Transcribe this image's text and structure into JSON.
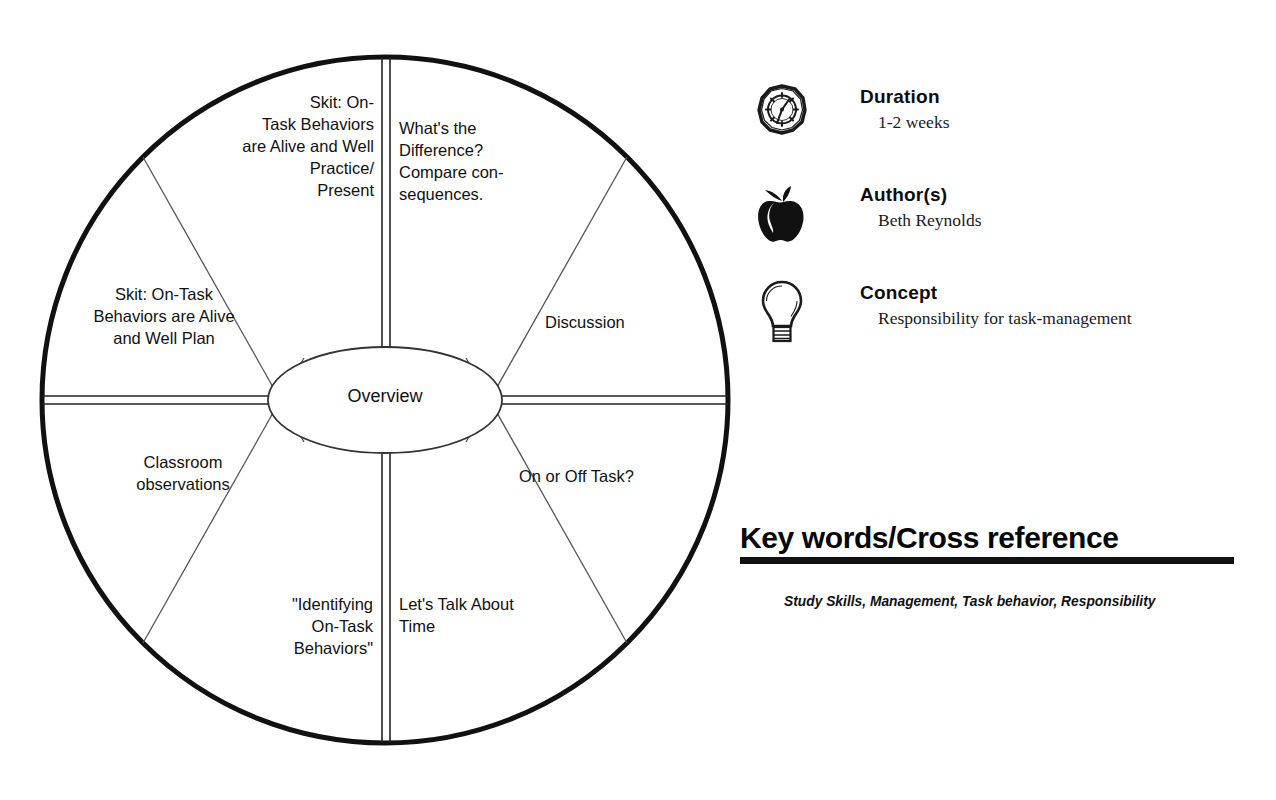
{
  "wheel": {
    "center_label": "Overview",
    "segments": [
      {
        "id": "skit-practice-present",
        "label": "Skit:  On-\nTask Behaviors\nare Alive and Well\nPractice/\nPresent",
        "align": "right"
      },
      {
        "id": "whats-the-difference",
        "label": "What's the\nDifference?\nCompare  con-\nsequences.",
        "align": "left"
      },
      {
        "id": "discussion",
        "label": "Discussion",
        "align": "left"
      },
      {
        "id": "on-or-off-task",
        "label": "On or Off Task?",
        "align": "left"
      },
      {
        "id": "lets-talk-about-time",
        "label": "Let's Talk About\nTime",
        "align": "left"
      },
      {
        "id": "identifying-on-task-behaviors",
        "label": "\"Identifying\nOn-Task\nBehaviors\"",
        "align": "right"
      },
      {
        "id": "classroom-observations",
        "label": "Classroom\nobservations",
        "align": "center"
      },
      {
        "id": "skit-plan",
        "label": "Skit:  On-Task\nBehaviors are Alive\nand Well Plan",
        "align": "center"
      }
    ]
  },
  "meta": {
    "items": [
      {
        "icon": "clock-icon",
        "heading": "Duration",
        "value": "1-2 weeks"
      },
      {
        "icon": "apple-icon",
        "heading": "Author(s)",
        "value": "Beth Reynolds"
      },
      {
        "icon": "lightbulb-icon",
        "heading": "Concept",
        "value": "Responsibility for task-management"
      }
    ]
  },
  "keywords": {
    "title": "Key words/Cross reference",
    "value": "Study Skills, Management, Task behavior, Responsibility"
  },
  "colors": {
    "ink": "#111111",
    "paper": "#ffffff",
    "hairline": "#555555"
  }
}
